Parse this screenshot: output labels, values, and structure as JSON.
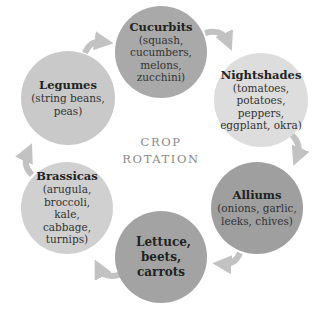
{
  "center": {
    "line1": "CROP",
    "line2": "ROTATION"
  },
  "colors": {
    "arrow": "#c2c2c2",
    "text": "#222222",
    "center_text": "#8a8a8a"
  },
  "nodes": [
    {
      "id": "cucurbits",
      "title": "Cucurbits",
      "desc": "(squash, cucumbers, melons, zucchini)",
      "color": "#a9a9a9",
      "cx": 161,
      "cy": 52,
      "r": 46
    },
    {
      "id": "nightshades",
      "title": "Nightshades",
      "desc": "(tomatoes, potatoes, peppers, eggplant, okra)",
      "color": "#dddddd",
      "cx": 261,
      "cy": 100,
      "r": 47
    },
    {
      "id": "alliums",
      "title": "Alliums",
      "desc": "(onions, garlic, leeks, chives)",
      "color": "#9f9f9f",
      "cx": 257,
      "cy": 208,
      "r": 46
    },
    {
      "id": "lettuce",
      "title": "Lettuce, beets, carrots",
      "desc": "",
      "color": "#a3a3a3",
      "cx": 161,
      "cy": 257,
      "r": 46
    },
    {
      "id": "brassicas",
      "title": "Brassicas",
      "desc": "(arugula, broccoli, kale, cabbage, turnips)",
      "color": "#d0d0d0",
      "cx": 67,
      "cy": 208,
      "r": 46
    },
    {
      "id": "legumes",
      "title": "Legumes",
      "desc": "(string beans, peas)",
      "color": "#c9c9c9",
      "cx": 68,
      "cy": 98,
      "r": 47
    }
  ]
}
